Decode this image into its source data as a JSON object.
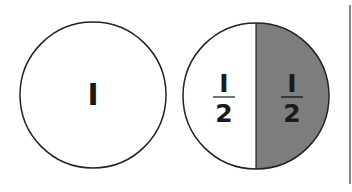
{
  "diagram": {
    "title": "",
    "whole_circle": {
      "label": "I"
    },
    "half_circle": {
      "left_half": {
        "numerator": "I",
        "denominator": "2",
        "fill": "#ffffff"
      },
      "right_half": {
        "numerator": "I",
        "denominator": "2",
        "fill": "#7d7d7d"
      }
    },
    "colors": {
      "stroke": "#222222",
      "shade": "#7d7d7d",
      "background": "#ffffff"
    }
  }
}
